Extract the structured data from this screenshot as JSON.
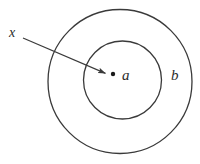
{
  "figure": {
    "type": "set-diagram",
    "background_color": "#ffffff",
    "stroke_color": "#3a3a3a",
    "text_color": "#2b2b2b",
    "outer_circle": {
      "name": "b",
      "label": "b",
      "center_x": 120,
      "center_y": 81.5,
      "radius": 72,
      "stroke_width": 1.3,
      "fill": "none"
    },
    "inner_circle": {
      "name": "a",
      "label": "a",
      "center_x": 122.5,
      "center_y": 80,
      "radius": 39,
      "stroke_width": 1.3,
      "fill": "none"
    },
    "point": {
      "name": "element-dot",
      "center_x": 113,
      "center_y": 74,
      "radius": 2.2,
      "fill": "#1a1a1a"
    },
    "arrow": {
      "label": "x",
      "start_x": 23,
      "start_y": 38,
      "end_x": 107,
      "end_y": 74,
      "stroke_width": 1.1,
      "head_length": 7,
      "head_width": 5
    },
    "labels": {
      "x": "x",
      "a": "a",
      "b": "b"
    }
  }
}
